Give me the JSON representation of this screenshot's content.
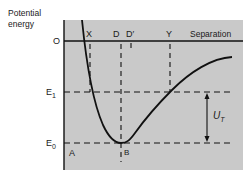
{
  "diagram": {
    "y_axis_label_line1": "Potential",
    "y_axis_label_line2": "energy",
    "x_axis_label": "Separation",
    "origin_label": "O",
    "level_labels": {
      "e1": "E",
      "e1_sub": "1",
      "e0": "E",
      "e0_sub": "0"
    },
    "point_labels": {
      "x": "X",
      "d": "D",
      "d_prime": "D′",
      "y": "Y",
      "a": "A",
      "b": "B"
    },
    "barrier_label": "U",
    "barrier_sub": "T",
    "colors": {
      "panel": "#c9c9c9",
      "line": "#111111"
    }
  }
}
